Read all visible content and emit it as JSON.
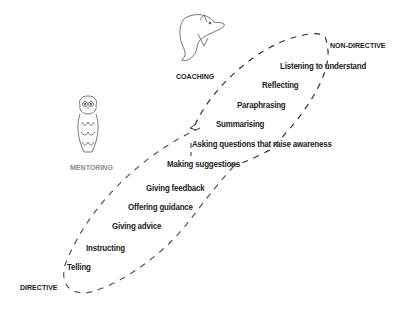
{
  "diagram": {
    "categories": {
      "coaching": "COACHING",
      "mentoring": "MENTORING",
      "directive": "DIRECTIVE",
      "non_directive": "NON-DIRECTIVE"
    },
    "icons": {
      "coaching": "dolphin-icon",
      "mentoring": "owl-icon"
    },
    "skills": [
      "Listening to understand",
      "Reflecting",
      "Paraphrasing",
      "Summarising",
      "Asking questions that raise awareness",
      "Making suggestions",
      "Giving feedback",
      "Offering guidance",
      "Giving advice",
      "Instructing",
      "Telling"
    ],
    "colors": {
      "text": "#222222",
      "mentoring_label": "#8c8c8c",
      "dash": "#333333",
      "illustration": "#555555"
    }
  }
}
